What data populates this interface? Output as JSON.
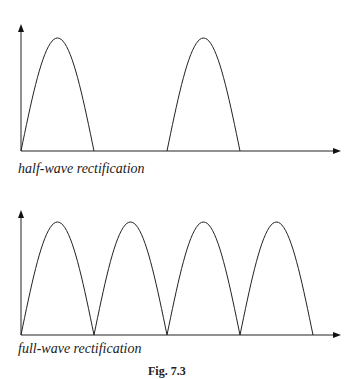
{
  "figure": {
    "panels": [
      {
        "id": "half",
        "label": "half-wave rectification",
        "humps": [
          0,
          2
        ],
        "description": "Only alternate half-cycles pass; gaps between pulses"
      },
      {
        "id": "full",
        "label": "full-wave rectification",
        "humps": [
          0,
          1,
          2,
          3
        ],
        "description": "Every half-cycle passes as a positive pulse"
      }
    ],
    "caption": "Fig. 7.3",
    "line_color": "#222222"
  }
}
